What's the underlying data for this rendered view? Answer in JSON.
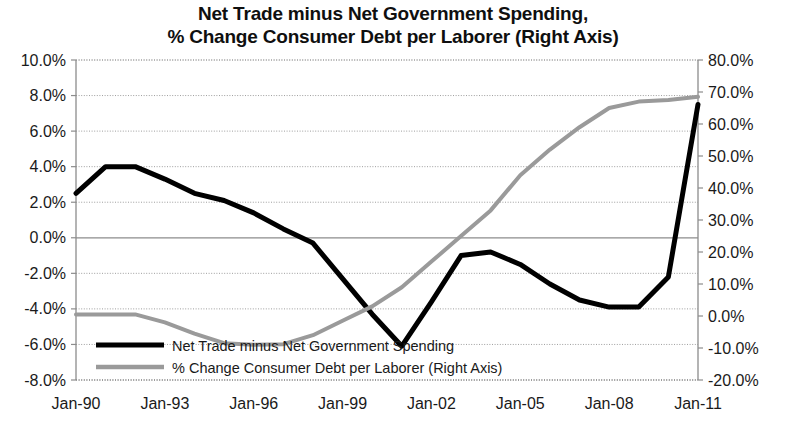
{
  "chart_data": {
    "type": "line",
    "title": "Net Trade minus Net Government Spending,\n% Change Consumer Debt per Laborer (Right Axis)",
    "title_line1": "Net Trade minus Net Government Spending,",
    "title_line2": "% Change Consumer Debt per Laborer (Right Axis)",
    "xlabel": "",
    "ylabel": "",
    "grid": true,
    "legend_position": "bottom-left-inside",
    "axes": {
      "left": {
        "ylim": [
          -8.0,
          10.0
        ],
        "tick_step": 2.0,
        "ticks": [
          "10.0%",
          "8.0%",
          "6.0%",
          "4.0%",
          "2.0%",
          "0.0%",
          "-2.0%",
          "-4.0%",
          "-6.0%",
          "-8.0%"
        ],
        "tick_values": [
          10.0,
          8.0,
          6.0,
          4.0,
          2.0,
          0.0,
          -2.0,
          -4.0,
          -6.0,
          -8.0
        ]
      },
      "right": {
        "ylim": [
          -20.0,
          80.0
        ],
        "tick_step": 10.0,
        "ticks": [
          "80.0%",
          "70.0%",
          "60.0%",
          "50.0%",
          "40.0%",
          "30.0%",
          "20.0%",
          "10.0%",
          "0.0%",
          "-10.0%",
          "-20.0%"
        ],
        "tick_values": [
          80.0,
          70.0,
          60.0,
          50.0,
          40.0,
          30.0,
          20.0,
          10.0,
          0.0,
          -10.0,
          -20.0
        ]
      },
      "x": {
        "ticks": [
          "Jan-90",
          "Jan-93",
          "Jan-96",
          "Jan-99",
          "Jan-02",
          "Jan-05",
          "Jan-08",
          "Jan-11"
        ],
        "tick_years": [
          1990,
          1993,
          1996,
          1999,
          2002,
          2005,
          2008,
          2011
        ],
        "xlim": [
          1990,
          2011
        ]
      }
    },
    "x": [
      1990,
      1991,
      1992,
      1993,
      1994,
      1995,
      1996,
      1997,
      1998,
      1999,
      2000,
      2001,
      2002,
      2003,
      2004,
      2005,
      2006,
      2007,
      2008,
      2009,
      2010,
      2011
    ],
    "series": [
      {
        "name": "Net Trade minus Net Government Spending",
        "axis": "left",
        "color": "#000000",
        "width": 5,
        "values": [
          2.5,
          4.0,
          4.0,
          3.3,
          2.5,
          2.1,
          1.4,
          0.5,
          -0.3,
          -2.3,
          -4.3,
          -6.1,
          -3.6,
          -1.0,
          -0.8,
          -1.5,
          -2.6,
          -3.5,
          -3.9,
          -3.9,
          -2.2,
          7.5
        ]
      },
      {
        "name": "% Change Consumer Debt per Laborer (Right Axis)",
        "axis": "right",
        "color": "#9a9a9a",
        "width": 4,
        "values": [
          0.5,
          0.5,
          0.5,
          -2.0,
          -5.5,
          -8.5,
          -9.0,
          -8.8,
          -6.0,
          -1.5,
          3.0,
          9.0,
          17.0,
          25.0,
          33.0,
          44.0,
          52.0,
          59.0,
          65.0,
          67.0,
          67.5,
          68.5
        ]
      }
    ],
    "series_right_extension": {
      "note": "tail beyond listed x to 2011-13"
    },
    "legend": [
      {
        "label": "Net Trade minus Net Government Spending",
        "color": "#000000"
      },
      {
        "label": "% Change Consumer Debt per Laborer (Right Axis)",
        "color": "#9a9a9a"
      }
    ]
  }
}
